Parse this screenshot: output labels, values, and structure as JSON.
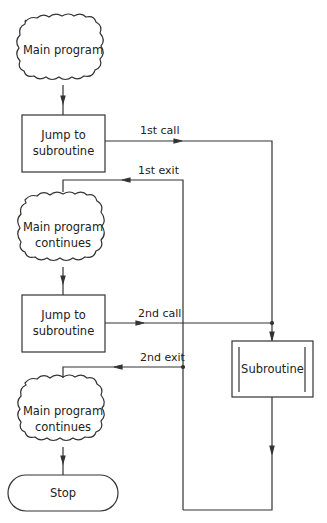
{
  "diagram": {
    "type": "flowchart",
    "nodes": [
      {
        "id": "main1",
        "shape": "cloud",
        "label": "Main program"
      },
      {
        "id": "jump1",
        "shape": "box",
        "line1": "Jump to",
        "line2": "subroutine"
      },
      {
        "id": "main2",
        "shape": "cloud",
        "line1": "Main program",
        "line2": "continues"
      },
      {
        "id": "jump2",
        "shape": "box",
        "line1": "Jump to",
        "line2": "subroutine"
      },
      {
        "id": "main3",
        "shape": "cloud",
        "line1": "Main program",
        "line2": "continues"
      },
      {
        "id": "stop",
        "shape": "terminator",
        "label": "Stop"
      },
      {
        "id": "sub",
        "shape": "predefined-process",
        "label": "Subroutine"
      }
    ],
    "edges": [
      {
        "from": "jump1",
        "to": "sub",
        "label": "1st call"
      },
      {
        "from": "sub",
        "to": "main2",
        "label": "1st exit"
      },
      {
        "from": "jump2",
        "to": "sub",
        "label": "2nd call"
      },
      {
        "from": "sub",
        "to": "main3",
        "label": "2nd exit"
      }
    ],
    "line_color": "#333333"
  }
}
